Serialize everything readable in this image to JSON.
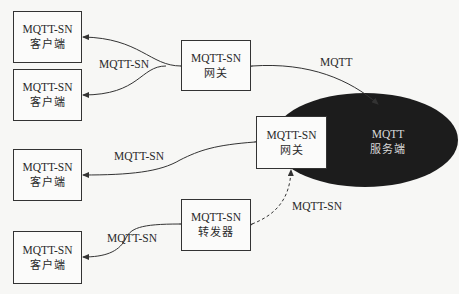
{
  "diagram": {
    "clients": [
      {
        "line1": "MQTT-SN",
        "line2": "客户端"
      },
      {
        "line1": "MQTT-SN",
        "line2": "客户端"
      },
      {
        "line1": "MQTT-SN",
        "line2": "客户端"
      },
      {
        "line1": "MQTT-SN",
        "line2": "客户端"
      }
    ],
    "gateway_top": {
      "line1": "MQTT-SN",
      "line2": "网关"
    },
    "gateway_mid": {
      "line1": "MQTT-SN",
      "line2": "网关"
    },
    "forwarder": {
      "line1": "MQTT-SN",
      "line2": "转发器"
    },
    "server": {
      "line1": "MQTT",
      "line2": "服务端"
    },
    "links": {
      "clients_to_gateway_top": "MQTT-SN",
      "gateway_top_to_server": "MQTT",
      "client3_to_gateway_mid": "MQTT-SN",
      "forwarder_to_gateway_mid": "MQTT-SN",
      "client4_to_forwarder": "MQTT-SN"
    },
    "colors": {
      "line": "#333333",
      "server_fill": "#1c1c1c",
      "server_text": "#d8d8d8",
      "box_fill": "#fbfbfa"
    }
  }
}
